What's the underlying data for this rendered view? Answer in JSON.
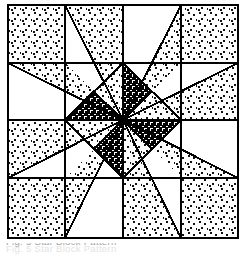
{
  "figure": {
    "kind": "quilt-block-pattern-diagram",
    "grid": {
      "divisions": 4,
      "x_lines": [
        8,
        65,
        123,
        181,
        238
      ],
      "y_lines": [
        5,
        63,
        120,
        178,
        238
      ]
    },
    "border": {
      "x": 8,
      "y": 5,
      "width": 230,
      "height": 233,
      "stroke": "#000000",
      "stroke_width": 2.4
    },
    "center": {
      "x": 123,
      "y": 120
    },
    "colors": {
      "ink": "#000000",
      "paper": "#ffffff",
      "light_stipple": "#000000",
      "dark_stipple": "#000000"
    },
    "fills": {
      "corner_squares": "light-stipple",
      "star_points_cardinal": "light-stipple",
      "star_points_diagonal": "plain-white",
      "center_medallion_pinwheel": "alternating dark-stipple and light-stipple"
    },
    "pieces": {
      "corner_squares": 4,
      "star_points": 8,
      "center_pinwheel_triangles": 8
    }
  },
  "caption": {
    "text": "Fig. 5  Star Block Pattern",
    "visible": "cropped"
  }
}
